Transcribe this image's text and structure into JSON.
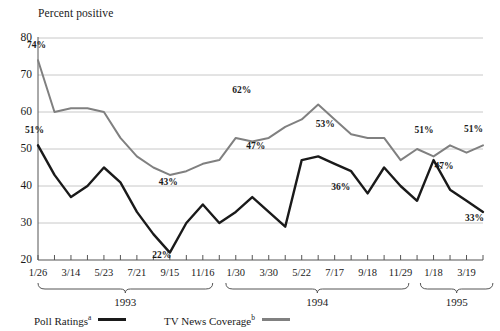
{
  "axis_title": "Percent positive",
  "y_ticks": [
    80,
    70,
    60,
    50,
    40,
    30,
    20
  ],
  "x_tick_labels": [
    "1/26",
    "3/14",
    "5/23",
    "7/21",
    "9/15",
    "11/16",
    "1/30",
    "3/30",
    "5/22",
    "7/17",
    "9/18",
    "11/29",
    "1/18",
    "3/19"
  ],
  "groups": [
    {
      "label": "1993",
      "start_index": 0,
      "end_index": 10.6
    },
    {
      "label": "1994",
      "start_index": 11.4,
      "end_index": 22.5
    },
    {
      "label": "1995",
      "start_index": 23.2,
      "end_index": 27.6
    }
  ],
  "legend": [
    {
      "label": "Poll Ratings",
      "note": "a",
      "color": "#1a1a1a"
    },
    {
      "label": "TV News Coverage",
      "note": "b",
      "color": "#808080"
    }
  ],
  "colors": {
    "poll_ratings": "#1a1a1a",
    "tv_news_coverage": "#808080",
    "gridline": "#c8c8c8",
    "axis": "#555555",
    "text": "#1a1a1a"
  },
  "chart_data": {
    "type": "line",
    "title": "",
    "subtitle": "",
    "xlabel": "",
    "ylabel": "Percent positive",
    "ylim": [
      20,
      80
    ],
    "y_ticks": [
      20,
      30,
      40,
      50,
      60,
      70,
      80
    ],
    "grid": true,
    "legend_position": "bottom",
    "x_major_tick_labels": [
      "1/26",
      "3/14",
      "5/23",
      "7/21",
      "9/15",
      "11/16",
      "1/30",
      "3/30",
      "5/22",
      "7/17",
      "9/18",
      "11/29",
      "1/18",
      "3/19"
    ],
    "x_minor_tick_count": 28,
    "year_groups": [
      "1993",
      "1994",
      "1995"
    ],
    "annotations": [
      {
        "text": "74%",
        "series": "TV News Coverage",
        "x_index": 0,
        "value": 74
      },
      {
        "text": "51%",
        "series": "Poll Ratings",
        "x_index": 0,
        "value": 51
      },
      {
        "text": "43%",
        "series": "TV News Coverage",
        "x_index": 8,
        "value": 43
      },
      {
        "text": "22%",
        "series": "Poll Ratings",
        "x_index": 7,
        "value": 22
      },
      {
        "text": "62%",
        "series": "TV News Coverage",
        "x_index": 13,
        "value": 62
      },
      {
        "text": "47%",
        "series": "Poll Ratings",
        "x_index": 13,
        "value": 47
      },
      {
        "text": "53%",
        "series": "TV News Coverage",
        "x_index": 18,
        "value": 53
      },
      {
        "text": "36%",
        "series": "Poll Ratings",
        "x_index": 19,
        "value": 36
      },
      {
        "text": "51%",
        "series": "TV News Coverage",
        "x_index": 24,
        "value": 51
      },
      {
        "text": "47%",
        "series": "Poll Ratings",
        "x_index": 24,
        "value": 47
      },
      {
        "text": "51%",
        "series": "TV News Coverage",
        "x_index": 27,
        "value": 51
      },
      {
        "text": "33%",
        "series": "Poll Ratings",
        "x_index": 27,
        "value": 33
      }
    ],
    "series": [
      {
        "name": "Poll Ratings",
        "note": "a",
        "color": "#1a1a1a",
        "values": [
          51,
          43,
          37,
          40,
          45,
          41,
          33,
          27,
          22,
          30,
          35,
          30,
          33,
          37,
          33,
          29,
          47,
          48,
          46,
          44,
          38,
          45,
          40,
          36,
          47,
          39,
          36,
          33
        ]
      },
      {
        "name": "TV News Coverage",
        "note": "b",
        "color": "#808080",
        "values": [
          74,
          60,
          61,
          61,
          60,
          53,
          48,
          45,
          43,
          44,
          46,
          47,
          53,
          52,
          53,
          56,
          58,
          62,
          58,
          54,
          53,
          53,
          47,
          50,
          48,
          51,
          49,
          51
        ]
      }
    ]
  }
}
